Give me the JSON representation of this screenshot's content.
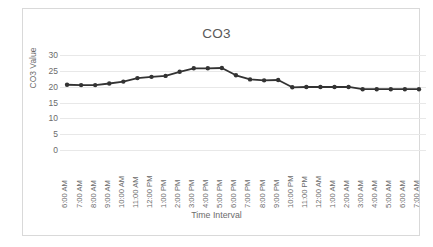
{
  "chart_data": {
    "type": "line",
    "title": "CO3",
    "xlabel": "Time Interval",
    "ylabel": "CO3 Value",
    "ylim": [
      0,
      30
    ],
    "yticks": [
      30,
      25,
      20,
      15,
      10,
      5,
      0
    ],
    "grid": true,
    "legend": null,
    "marker": "circle",
    "line_color": "#333333",
    "marker_color": "#333333",
    "grid_color": "#e8e8e8",
    "categories": [
      "6:00 AM",
      "7:00 AM",
      "8:00 AM",
      "9:00 AM",
      "10:00 AM",
      "11:00 AM",
      "12:00 PM",
      "1:00 PM",
      "2:00 PM",
      "3:00 PM",
      "4:00 PM",
      "5:00 PM",
      "6:00 PM",
      "7:00 PM",
      "8:00 PM",
      "9:00 PM",
      "10:00 PM",
      "11:00 PM",
      "12:00 AM",
      "1:00 AM",
      "2:00 AM",
      "3:00 AM",
      "4:00 AM",
      "5:00 AM",
      "6:00 AM",
      "7:00 AM"
    ],
    "values": [
      20.6,
      20.5,
      20.5,
      21.0,
      21.6,
      22.7,
      23.1,
      23.4,
      24.7,
      25.8,
      25.8,
      25.9,
      23.6,
      22.3,
      22.0,
      22.1,
      19.8,
      19.9,
      19.9,
      19.9,
      19.9,
      19.2,
      19.2,
      19.2,
      19.2,
      19.2
    ]
  }
}
